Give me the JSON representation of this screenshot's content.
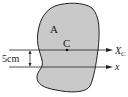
{
  "diagram": {
    "region_label": "A",
    "centroid_label": "C",
    "axis_centroid_label": "X",
    "axis_centroid_subscript": "C",
    "axis_label": "x",
    "distance_label": "5cm",
    "colors": {
      "fill": "#c9c9c9",
      "stroke": "#222222",
      "background": "#ffffff"
    }
  }
}
